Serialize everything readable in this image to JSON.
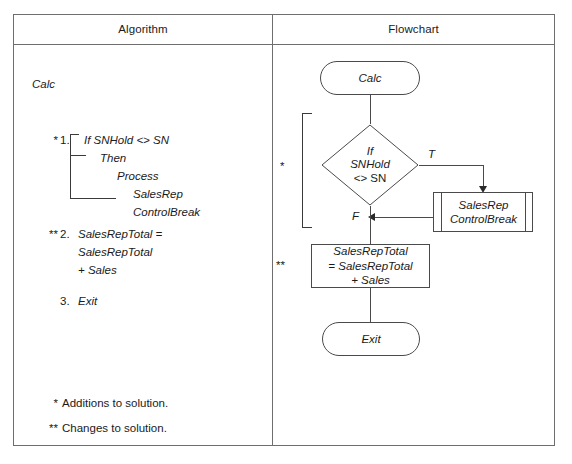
{
  "table": {
    "headers": {
      "algorithm": "Algorithm",
      "flowchart": "Flowchart"
    }
  },
  "algorithm": {
    "title": "Calc",
    "step1": {
      "marker": "*",
      "number": "1.",
      "lines": [
        "If SNHold <> SN",
        "Then",
        "Process",
        "SalesRep",
        "ControlBreak"
      ]
    },
    "step2": {
      "marker": "**",
      "number": "2.",
      "lines": [
        "SalesRepTotal =",
        "SalesRepTotal",
        "+ Sales"
      ]
    },
    "step3": {
      "marker": "",
      "number": "3.",
      "lines": [
        "Exit"
      ]
    },
    "legend": [
      {
        "marker": "*",
        "text": "Additions to solution."
      },
      {
        "marker": "**",
        "text": "Changes to solution."
      }
    ]
  },
  "flowchart": {
    "start": "Calc",
    "decision": {
      "line1": "If",
      "line2": "SNHold",
      "line3": "<> SN",
      "true_label": "T",
      "false_label": "F"
    },
    "predefined_process": {
      "line1": "SalesRep",
      "line2": "ControlBreak"
    },
    "process": {
      "line1": "SalesRepTotal",
      "line2": "= SalesRepTotal",
      "line3": "+ Sales"
    },
    "end": "Exit",
    "markers": {
      "addition": "*",
      "change": "**"
    }
  },
  "colors": {
    "frame": "#6e6e6e",
    "shape_stroke": "#4a4a4a",
    "text": "#1a1a1a",
    "background": "#ffffff"
  }
}
